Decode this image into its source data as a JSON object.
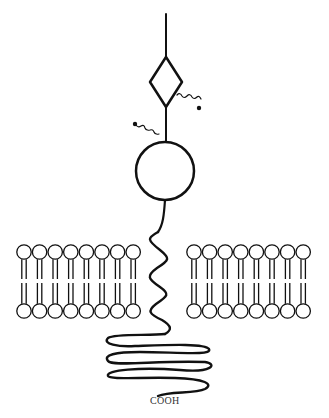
{
  "diagram": {
    "type": "transmembrane-protein",
    "labels": {
      "c_terminus": "COOH"
    },
    "colors": {
      "stroke": "#111111",
      "background": "#ffffff"
    },
    "membrane": {
      "left_lipid_count": 8,
      "right_lipid_count": 8
    }
  }
}
